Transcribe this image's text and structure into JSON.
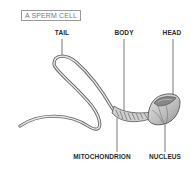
{
  "title": "A SPERM CELL",
  "labels": {
    "tail": "TAIL",
    "body": "BODY",
    "head": "HEAD",
    "mitochondrion": "MITOCHONDRION",
    "nucleus": "NUCLEUS"
  },
  "colors": {
    "outline": "#555555",
    "fill_light": "#d9d9d9",
    "fill_mid": "#a8a8a8",
    "fill_dark": "#777777",
    "label_text": "#2a2a2a",
    "title_text": "#7a7a7a",
    "leader_line": "#555555"
  }
}
